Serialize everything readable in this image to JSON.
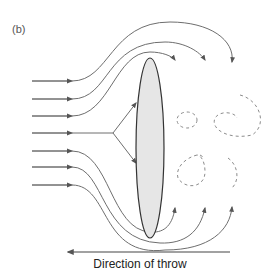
{
  "panel_label": "(b)",
  "caption": "Direction of throw",
  "colors": {
    "stream": "#6e6e6e",
    "eddy": "#8c8c8c",
    "body_fill": "#e6e6e6",
    "body_stroke": "#333333",
    "arrow": "#555555"
  },
  "elements": {
    "incoming_streamlines": 8,
    "outgoing_top_arrows": 3,
    "outgoing_bottom_arrows": 3,
    "stagnation_branches": 2,
    "eddies": 5
  }
}
